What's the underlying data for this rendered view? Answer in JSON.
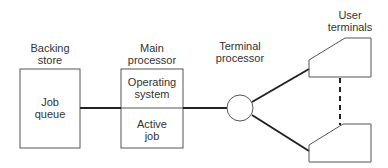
{
  "diagram": {
    "backing_store": {
      "title_line1": "Backing",
      "title_line2": "store",
      "content_line1": "Job",
      "content_line2": "queue"
    },
    "main_processor": {
      "title_line1": "Main",
      "title_line2": "processor",
      "top_line1": "Operating",
      "top_line2": "system",
      "bottom_line1": "Active",
      "bottom_line2": "job"
    },
    "terminal_processor": {
      "title_line1": "Terminal",
      "title_line2": "processor"
    },
    "user_terminals": {
      "title_line1": "User",
      "title_line2": "terminals"
    },
    "colors": {
      "stroke": "#333333",
      "background": "#ffffff"
    }
  }
}
